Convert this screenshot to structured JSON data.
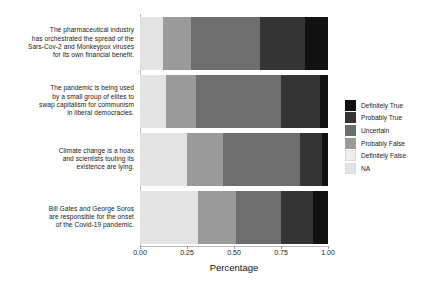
{
  "chart_data": {
    "type": "bar",
    "orientation": "horizontal",
    "stacked": true,
    "normalized": true,
    "title": "",
    "xlabel": "Percentage",
    "ylabel": "",
    "xlim": [
      0,
      1
    ],
    "xticks": [
      "0.00",
      "0.25",
      "0.50",
      "0.75",
      "1.00"
    ],
    "xtick_values": [
      0,
      0.25,
      0.5,
      0.75,
      1
    ],
    "grid": false,
    "legend_position": "right",
    "categories": [
      "The pharmaceutical industry has orchestrated the spread of the Sars-Cov-2 and Monkeypox viruses for its own financial benefit.",
      "The pandemic is being used by a small group of elites to swap capitalism for communism in liberal democracies.",
      "Climate change is a hoax and scientists touting its existence are lying.",
      "Bill Gates and George Soros are responsible for the onset of the Covid-19 pandemic."
    ],
    "category_lines": [
      [
        "The pharmaceutical industry",
        "has orchestrated the spread of the",
        "Sars-Cov-2 and Monkeypox viruses",
        "for its own financial benefit."
      ],
      [
        "The pandemic is being used",
        "by a small group of elites to",
        "swap capitalism for communism",
        "in liberal democracies."
      ],
      [
        "Climate change is a hoax",
        "and scientists touting its",
        "existence are lying."
      ],
      [
        "Bill Gates and George Soros",
        "are responsible for the onset",
        "of the Covid-19 pandemic."
      ]
    ],
    "series": [
      {
        "name": "NA",
        "color": "#e3e3e3",
        "values": [
          0.12,
          0.14,
          0.25,
          0.31
        ]
      },
      {
        "name": "Definitely False",
        "color": "#eeeeee",
        "values": [
          0.0,
          0.0,
          0.0,
          0.0
        ]
      },
      {
        "name": "Probably False",
        "color": "#9a9a9a",
        "values": [
          0.15,
          0.16,
          0.19,
          0.2
        ]
      },
      {
        "name": "Uncertain",
        "color": "#6e6e6e",
        "values": [
          0.37,
          0.45,
          0.41,
          0.24
        ]
      },
      {
        "name": "Probably True",
        "color": "#343434",
        "values": [
          0.24,
          0.21,
          0.12,
          0.17
        ]
      },
      {
        "name": "Definitely True",
        "color": "#111111",
        "values": [
          0.12,
          0.04,
          0.03,
          0.08
        ]
      }
    ],
    "stack_order_left_to_right": [
      "NA",
      "Definitely False",
      "Probably False",
      "Uncertain",
      "Probably True",
      "Definitely True"
    ],
    "boundaries_cumulative": [
      [
        0.12,
        0.12,
        0.27,
        0.64,
        0.88,
        1.0
      ],
      [
        0.14,
        0.14,
        0.3,
        0.75,
        0.96,
        1.0
      ],
      [
        0.25,
        0.25,
        0.44,
        0.85,
        0.97,
        1.0
      ],
      [
        0.31,
        0.31,
        0.51,
        0.75,
        0.92,
        1.0
      ]
    ]
  },
  "legend": {
    "items": [
      {
        "label": "Definitely True",
        "color": "#111111"
      },
      {
        "label": "Probably True",
        "color": "#343434"
      },
      {
        "label": "Uncertain",
        "color": "#6e6e6e"
      },
      {
        "label": "Probably False",
        "color": "#9a9a9a"
      },
      {
        "label": "Definitely False",
        "color": "#eeeeee"
      },
      {
        "label": "NA",
        "color": "#e3e3e3"
      }
    ]
  },
  "axis": {
    "x_title": "Percentage"
  }
}
